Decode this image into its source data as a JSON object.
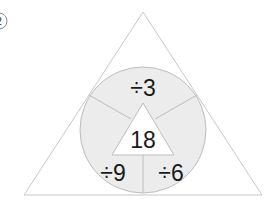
{
  "problem": {
    "number_label": "2",
    "center_value": "18",
    "segments": [
      {
        "position": "top",
        "label": "÷3"
      },
      {
        "position": "bottom-left",
        "label": "÷9"
      },
      {
        "position": "bottom-right",
        "label": "÷6"
      }
    ]
  },
  "colors": {
    "circle_fill": "#ececec",
    "line": "#bdbdbd",
    "inner_triangle_fill": "#ffffff",
    "text": "#1a1a1a"
  }
}
